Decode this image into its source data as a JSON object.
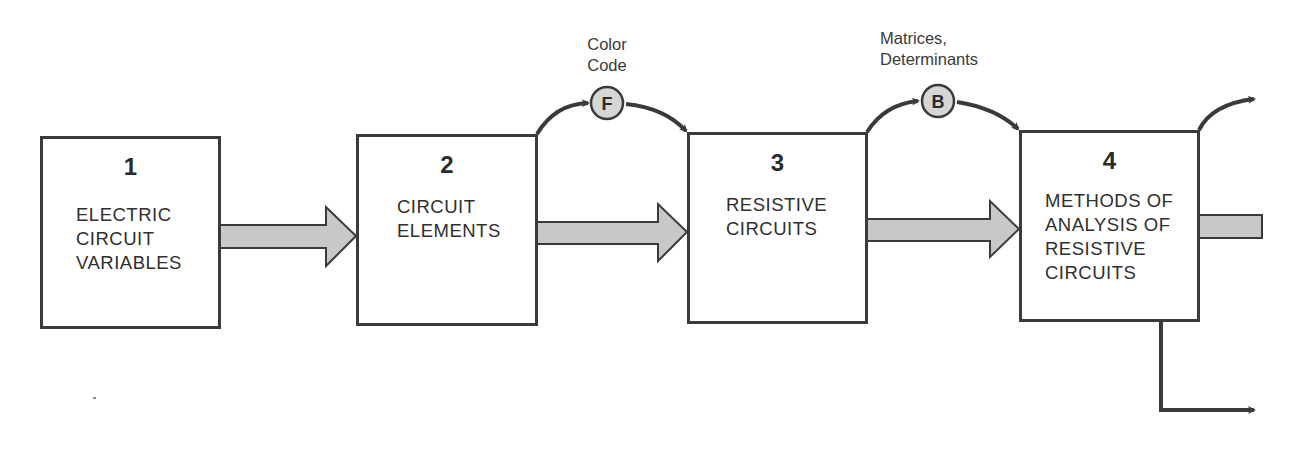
{
  "diagram": {
    "type": "flowchart",
    "colors": {
      "stroke": "#3a3a3a",
      "arrow_fill": "#c8c8c8",
      "badge_fill": "#d6d6d6"
    },
    "boxes": [
      {
        "number": "1",
        "label": "ELECTRIC\nCIRCUIT\nVARIABLES"
      },
      {
        "number": "2",
        "label": "CIRCUIT\nELEMENTS"
      },
      {
        "number": "3",
        "label": "RESISTIVE\nCIRCUITS"
      },
      {
        "number": "4",
        "label": "METHODS OF\nANALYSIS OF\nRESISTIVE\nCIRCUITS"
      }
    ],
    "side_topics": [
      {
        "badge": "F",
        "label": "Color\nCode",
        "from_box": "2",
        "to_box": "3"
      },
      {
        "badge": "B",
        "label": "Matrices,\nDeterminants",
        "from_box": "3",
        "to_box": "4"
      }
    ],
    "connections": [
      {
        "from": "1",
        "to": "2",
        "style": "thick-gray-arrow"
      },
      {
        "from": "2",
        "to": "3",
        "style": "thick-gray-arrow"
      },
      {
        "from": "3",
        "to": "4",
        "style": "thick-gray-arrow"
      },
      {
        "from": "4",
        "to": "offscreen-right",
        "style": "thick-gray-arrow"
      },
      {
        "from": "4",
        "to": "offscreen-top-right",
        "style": "curved-arrow"
      },
      {
        "from": "4",
        "to": "offscreen-bottom-right",
        "style": "elbow-arrow"
      }
    ]
  }
}
